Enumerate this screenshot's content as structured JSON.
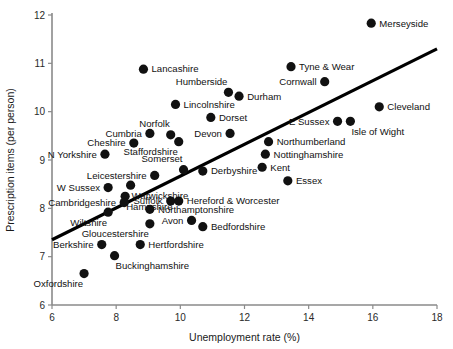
{
  "chart_data": {
    "type": "scatter",
    "title": "",
    "xlabel": "Unemployment rate (%)",
    "ylabel": "Prescription items (per person)",
    "xlim": [
      6,
      18
    ],
    "ylim": [
      6,
      12
    ],
    "xticks": [
      6,
      8,
      10,
      12,
      14,
      16,
      18
    ],
    "yticks": [
      6,
      7,
      8,
      9,
      10,
      11,
      12
    ],
    "grid": false,
    "legend": "none",
    "series_name": "English counties",
    "trend_line": {
      "present": true,
      "x_start": 6.0,
      "y_start": 7.35,
      "x_end": 18.0,
      "y_end": 11.3,
      "color": "#000000"
    },
    "point_color": "#111111",
    "points": [
      {
        "label": "Merseyside",
        "x": 15.95,
        "y": 11.83,
        "label_pos": "right"
      },
      {
        "label": "Tyne & Wear",
        "x": 13.45,
        "y": 10.93,
        "label_pos": "right"
      },
      {
        "label": "Lancashire",
        "x": 8.85,
        "y": 10.88,
        "label_pos": "right"
      },
      {
        "label": "Cornwall",
        "x": 14.5,
        "y": 10.62,
        "label_pos": "left"
      },
      {
        "label": "Humberside",
        "x": 11.5,
        "y": 10.4,
        "label_pos": "above-left"
      },
      {
        "label": "Durham",
        "x": 11.83,
        "y": 10.32,
        "label_pos": "right"
      },
      {
        "label": "Lincolnshire",
        "x": 9.85,
        "y": 10.15,
        "label_pos": "right"
      },
      {
        "label": "Cleveland",
        "x": 16.2,
        "y": 10.1,
        "label_pos": "right"
      },
      {
        "label": "Dorset",
        "x": 10.95,
        "y": 9.88,
        "label_pos": "right"
      },
      {
        "label": "E Sussex",
        "x": 14.9,
        "y": 9.8,
        "label_pos": "left"
      },
      {
        "label": "Isle of Wight",
        "x": 15.3,
        "y": 9.8,
        "label_pos": "below-right"
      },
      {
        "label": "Norfolk",
        "x": 9.7,
        "y": 9.52,
        "label_pos": "above-left"
      },
      {
        "label": "Cumbria",
        "x": 9.05,
        "y": 9.55,
        "label_pos": "left"
      },
      {
        "label": "Devon",
        "x": 11.55,
        "y": 9.55,
        "label_pos": "left"
      },
      {
        "label": "Cheshire",
        "x": 8.55,
        "y": 9.35,
        "label_pos": "left"
      },
      {
        "label": "Staffordshire",
        "x": 9.95,
        "y": 9.38,
        "label_pos": "below-left"
      },
      {
        "label": "Northumberland",
        "x": 12.75,
        "y": 9.38,
        "label_pos": "right"
      },
      {
        "label": "N Yorkshire",
        "x": 7.65,
        "y": 9.12,
        "label_pos": "left"
      },
      {
        "label": "Nottinghamshire",
        "x": 12.65,
        "y": 9.12,
        "label_pos": "right"
      },
      {
        "label": "Kent",
        "x": 12.55,
        "y": 8.85,
        "label_pos": "right"
      },
      {
        "label": "Somerset",
        "x": 10.1,
        "y": 8.8,
        "label_pos": "above-left"
      },
      {
        "label": "Derbyshire",
        "x": 10.7,
        "y": 8.77,
        "label_pos": "right"
      },
      {
        "label": "Leicestershire",
        "x": 9.2,
        "y": 8.68,
        "label_pos": "left"
      },
      {
        "label": "Essex",
        "x": 13.35,
        "y": 8.57,
        "label_pos": "right"
      },
      {
        "label": "Warwickshire",
        "x": 8.45,
        "y": 8.48,
        "label_pos": "below-right"
      },
      {
        "label": "W Sussex",
        "x": 7.75,
        "y": 8.43,
        "label_pos": "left"
      },
      {
        "label": "Hampshire",
        "x": 8.28,
        "y": 8.25,
        "label_pos": "below-right"
      },
      {
        "label": "Cambridgeshire",
        "x": 8.25,
        "y": 8.12,
        "label_pos": "left"
      },
      {
        "label": "Suffolk",
        "x": 9.7,
        "y": 8.15,
        "label_pos": "left"
      },
      {
        "label": "Hereford & Worcester",
        "x": 9.95,
        "y": 8.15,
        "label_pos": "right"
      },
      {
        "label": "Northamptonshire",
        "x": 9.05,
        "y": 7.98,
        "label_pos": "right"
      },
      {
        "label": "Wiltshire",
        "x": 7.75,
        "y": 7.92,
        "label_pos": "below-left"
      },
      {
        "label": "Avon",
        "x": 10.35,
        "y": 7.75,
        "label_pos": "left"
      },
      {
        "label": "Gloucestershire",
        "x": 9.05,
        "y": 7.68,
        "label_pos": "below-left"
      },
      {
        "label": "Bedfordshire",
        "x": 10.7,
        "y": 7.62,
        "label_pos": "right"
      },
      {
        "label": "Hertfordshire",
        "x": 8.75,
        "y": 7.25,
        "label_pos": "right"
      },
      {
        "label": "Berkshire",
        "x": 7.55,
        "y": 7.25,
        "label_pos": "left"
      },
      {
        "label": "Buckinghamshire",
        "x": 7.95,
        "y": 7.02,
        "label_pos": "below-right"
      },
      {
        "label": "Oxfordshire",
        "x": 7.0,
        "y": 6.65,
        "label_pos": "below-left"
      }
    ]
  }
}
